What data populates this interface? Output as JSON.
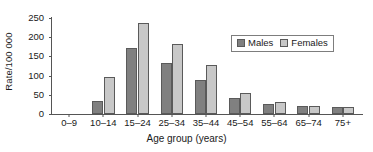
{
  "chart_data": {
    "type": "bar",
    "title": "",
    "xlabel": "Age group (years)",
    "ylabel": "Rate/100 000",
    "ylim": [
      0,
      250
    ],
    "yticks": [
      0,
      50,
      100,
      150,
      200,
      250
    ],
    "ytick_labels": [
      "0",
      "50",
      "100",
      "150",
      "200",
      "250"
    ],
    "grid": false,
    "legend_position": "upper right",
    "categories": [
      "0–9",
      "10–14",
      "15–24",
      "25–34",
      "35–44",
      "45–54",
      "55–64",
      "65–74",
      "75+"
    ],
    "series": [
      {
        "name": "Males",
        "color": "#808080",
        "values": [
          0,
          35,
          172,
          133,
          88,
          42,
          27,
          22,
          17
        ]
      },
      {
        "name": "Females",
        "color": "#c8c8c8",
        "values": [
          0,
          97,
          238,
          182,
          128,
          55,
          30,
          22,
          17
        ]
      }
    ]
  },
  "legend": {
    "entries": [
      {
        "label": "Males"
      },
      {
        "label": "Females"
      }
    ]
  }
}
